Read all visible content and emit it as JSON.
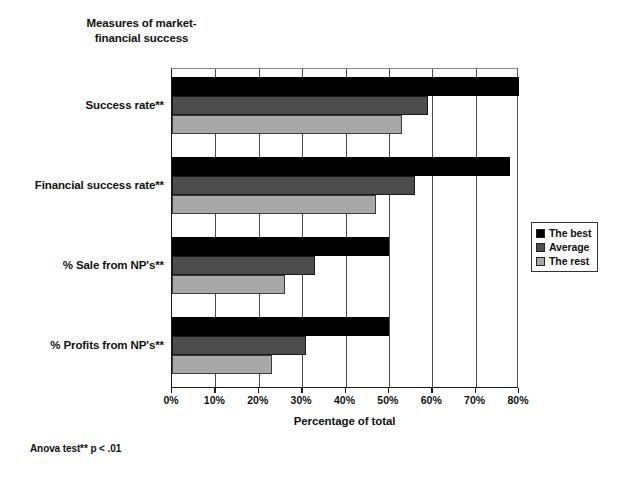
{
  "chart_data": {
    "type": "bar",
    "orientation": "horizontal",
    "xlabel": "Percentage of total",
    "ylabel": "",
    "xlim": [
      0,
      80
    ],
    "xtick_labels": [
      "0%",
      "10%",
      "20%",
      "30%",
      "40%",
      "50%",
      "60%",
      "70%",
      "80%"
    ],
    "xtick_values": [
      0,
      10,
      20,
      30,
      40,
      50,
      60,
      70,
      80
    ],
    "grid": true,
    "legend_position": "right",
    "categories": [
      "Success rate**",
      "Financial success rate**",
      "% Sale from NP's**",
      "% Profits from NP's**"
    ],
    "series": [
      {
        "name": "The best",
        "color": "#000000",
        "values": [
          80,
          78,
          50,
          50
        ]
      },
      {
        "name": "Average",
        "color": "#4d4d4d",
        "values": [
          59,
          56,
          33,
          31
        ]
      },
      {
        "name": "The rest",
        "color": "#a8a8a8",
        "values": [
          53,
          47,
          26,
          23
        ]
      }
    ],
    "annotations": [
      "Anova test** p < .01"
    ]
  },
  "figure": {
    "title_line1": "Measures of market-",
    "title_line2": "financial success",
    "x_axis_title": "Percentage of total",
    "footnote": "Anova test** p < .01"
  },
  "legend": {
    "items": [
      {
        "label": "The best",
        "color": "#000000"
      },
      {
        "label": "Average",
        "color": "#4d4d4d"
      },
      {
        "label": "The rest",
        "color": "#a8a8a8"
      }
    ]
  }
}
